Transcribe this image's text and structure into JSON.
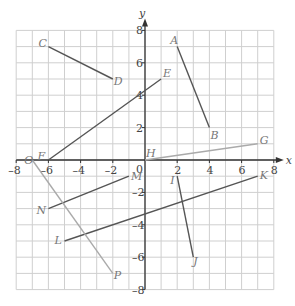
{
  "chart_data": {
    "type": "scatter",
    "title": "",
    "xlabel": "x",
    "ylabel": "y",
    "xlim": [
      -8,
      8
    ],
    "ylim": [
      -8,
      8
    ],
    "grid": true,
    "x_ticks": [
      "-8",
      "-6",
      "-4",
      "-2",
      "0",
      "2",
      "4",
      "6",
      "8"
    ],
    "y_ticks": [
      "8",
      "6",
      "4",
      "2",
      "-2",
      "-4",
      "-6",
      "-8"
    ],
    "segments": [
      {
        "name": "AB",
        "from": {
          "label": "A",
          "x": 2,
          "y": 7
        },
        "to": {
          "label": "B",
          "x": 4,
          "y": 2
        },
        "color": "#555555"
      },
      {
        "name": "CD",
        "from": {
          "label": "C",
          "x": -6,
          "y": 7
        },
        "to": {
          "label": "D",
          "x": -2,
          "y": 5
        },
        "color": "#555555"
      },
      {
        "name": "EF",
        "from": {
          "label": "E",
          "x": 1,
          "y": 5
        },
        "to": {
          "label": "F",
          "x": -6,
          "y": 0
        },
        "color": "#555555"
      },
      {
        "name": "GH",
        "from": {
          "label": "G",
          "x": 7,
          "y": 1
        },
        "to": {
          "label": "H",
          "x": 0,
          "y": 0
        },
        "color": "#aaaaaa"
      },
      {
        "name": "IJ",
        "from": {
          "label": "I",
          "x": 2,
          "y": -1
        },
        "to": {
          "label": "J",
          "x": 3,
          "y": -6
        },
        "color": "#555555"
      },
      {
        "name": "KL",
        "from": {
          "label": "K",
          "x": 7,
          "y": -1
        },
        "to": {
          "label": "L",
          "x": -5,
          "y": -5
        },
        "color": "#555555"
      },
      {
        "name": "MN",
        "from": {
          "label": "M",
          "x": -1,
          "y": -1
        },
        "to": {
          "label": "N",
          "x": -6,
          "y": -3
        },
        "color": "#555555"
      },
      {
        "name": "OP",
        "from": {
          "label": "O",
          "x": -7,
          "y": 0
        },
        "to": {
          "label": "P",
          "x": -2,
          "y": -7
        },
        "color": "#aaaaaa"
      }
    ]
  },
  "axes": {
    "x_label": "x",
    "y_label": "y",
    "origin_label": "0"
  },
  "colors": {
    "grid": "#cfcfcf",
    "axis": "#333333",
    "dark_segment": "#555555",
    "light_segment": "#aaaaaa"
  }
}
